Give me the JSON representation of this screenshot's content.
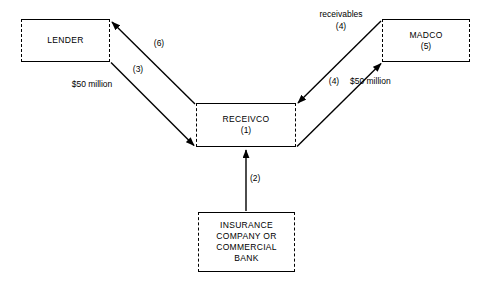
{
  "diagram": {
    "line_color": "#000000",
    "background": "#ffffff",
    "nodes": [
      {
        "id": "lender",
        "label": "LENDER",
        "number": "",
        "x": 21,
        "y": 19,
        "w": 89,
        "h": 43
      },
      {
        "id": "receivco",
        "label": "RECEIVCO",
        "number": "(1)",
        "x": 196,
        "y": 103,
        "w": 100,
        "h": 44
      },
      {
        "id": "madco",
        "label": "MADCO",
        "number": "(5)",
        "x": 382,
        "y": 19,
        "w": 88,
        "h": 43
      },
      {
        "id": "insurance",
        "label": "INSURANCE\nCOMPANY OR\nCOMMERCIAL\nBANK",
        "number": "",
        "x": 198,
        "y": 212,
        "w": 97,
        "h": 60
      }
    ],
    "edges": [
      {
        "id": "lender-to-receivco",
        "step": "(3)",
        "amount": "$50 million",
        "from": "lender",
        "to": "receivco"
      },
      {
        "id": "receivco-to-lender",
        "step": "(6)",
        "amount": "",
        "from": "receivco",
        "to": "lender"
      },
      {
        "id": "madco-to-receivco",
        "step": "(4)",
        "amount": "receivables",
        "from": "madco",
        "to": "receivco"
      },
      {
        "id": "receivco-to-madco",
        "step": "(4)",
        "amount": "$50 million",
        "from": "receivco",
        "to": "madco"
      },
      {
        "id": "insurance-to-receivco",
        "step": "(2)",
        "amount": "",
        "from": "insurance",
        "to": "receivco"
      }
    ],
    "labels": {
      "step_6": "(6)",
      "step_3": "(3)",
      "amount_lender": "$50 million",
      "receivables": "receivables",
      "step_4_receivables": "(4)",
      "step_4_cash": "(4)",
      "amount_madco": "$50 million",
      "step_2": "(2)"
    }
  }
}
